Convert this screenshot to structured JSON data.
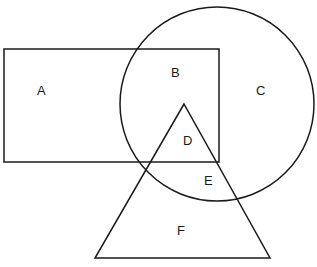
{
  "diagram": {
    "shapes": {
      "rectangle": {
        "x": 4,
        "y": 49,
        "width": 215,
        "height": 113
      },
      "circle": {
        "cx": 217,
        "cy": 104,
        "r": 97
      },
      "triangle": {
        "points": "184,104 95,258 270,258"
      }
    },
    "labels": [
      {
        "id": "A",
        "text": "A",
        "x": 37,
        "y": 95
      },
      {
        "id": "B",
        "text": "B",
        "x": 171,
        "y": 77
      },
      {
        "id": "C",
        "text": "C",
        "x": 256,
        "y": 95
      },
      {
        "id": "D",
        "text": "D",
        "x": 183,
        "y": 145
      },
      {
        "id": "E",
        "text": "E",
        "x": 204,
        "y": 185
      },
      {
        "id": "F",
        "text": "F",
        "x": 177,
        "y": 235
      }
    ]
  }
}
